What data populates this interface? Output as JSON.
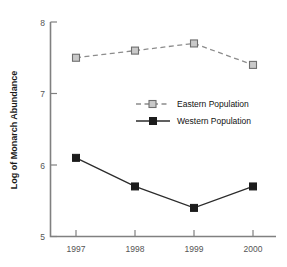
{
  "chart_data": {
    "type": "line",
    "title": "",
    "xlabel": "",
    "ylabel": "Log of Monarch Abundance",
    "categories": [
      "1997",
      "1998",
      "1999",
      "2000"
    ],
    "x": [
      1997,
      1998,
      1999,
      2000
    ],
    "xlim": [
      1996.6,
      2000.6
    ],
    "ylim": [
      5,
      8
    ],
    "yticks": [
      "5",
      "6",
      "7",
      "8"
    ],
    "ytick_values": [
      5,
      6,
      7,
      8
    ],
    "grid": false,
    "legend_position": "center",
    "series": [
      {
        "name": "Eastern Population",
        "values": [
          7.5,
          7.6,
          7.7,
          7.4
        ],
        "line_style": "dashed",
        "marker": "open-square",
        "color": "#8c8c8c"
      },
      {
        "name": "Western Population",
        "values": [
          6.1,
          5.7,
          5.4,
          5.7
        ],
        "line_style": "solid",
        "marker": "filled-square",
        "color": "#1c1c1c"
      }
    ]
  },
  "axes": {
    "y_title": "Log of Monarch Abundance",
    "y_tick_labels": [
      "8",
      "7",
      "6",
      "5"
    ],
    "x_tick_labels": [
      "1997",
      "1998",
      "1999",
      "2000"
    ]
  },
  "legend": {
    "entries": [
      {
        "label": "Eastern Population"
      },
      {
        "label": "Western Population"
      }
    ]
  },
  "colors": {
    "eastern": "#8c8c8c",
    "western": "#1c1c1c",
    "axis": "#808080",
    "text": "#111111",
    "background": "#ffffff"
  }
}
